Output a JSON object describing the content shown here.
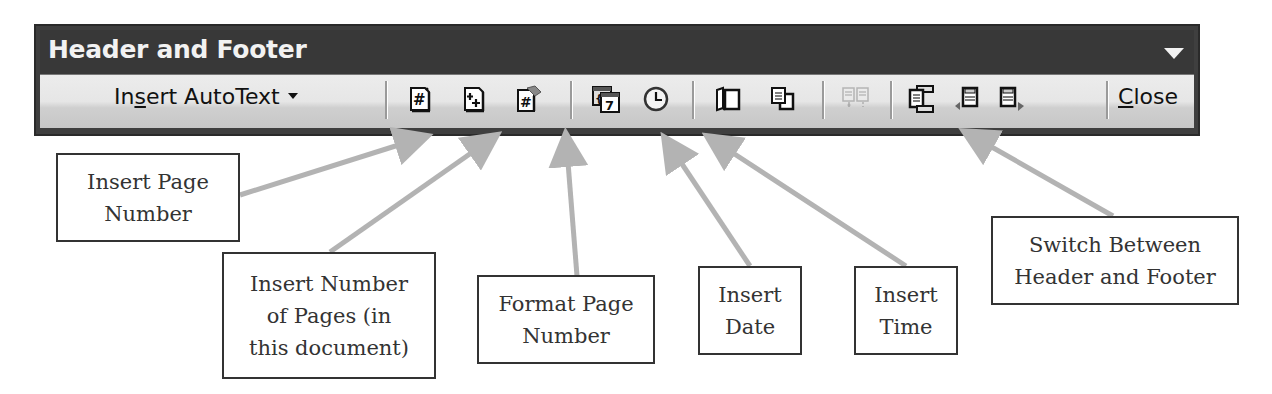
{
  "toolbar": {
    "title": "Header and Footer",
    "autotext": {
      "prefix": "In",
      "underlined": "s",
      "suffix": "ert AutoText"
    },
    "close": {
      "underlined": "C",
      "suffix": "lose"
    },
    "buttons": [
      {
        "name": "insert-page-number",
        "icon": "page-hash-icon"
      },
      {
        "name": "insert-number-of-pages",
        "icon": "page-plus-icon"
      },
      {
        "name": "format-page-number",
        "icon": "page-hash-format-icon"
      },
      {
        "name": "insert-date",
        "icon": "calendar-icon",
        "glyph": "7"
      },
      {
        "name": "insert-time",
        "icon": "clock-icon"
      },
      {
        "name": "page-setup",
        "icon": "open-book-icon"
      },
      {
        "name": "show-hide-document-text",
        "icon": "document-overlap-icon"
      },
      {
        "name": "same-as-previous",
        "icon": "link-pages-icon",
        "disabled": true
      },
      {
        "name": "switch-between-header-footer",
        "icon": "header-footer-switch-icon"
      },
      {
        "name": "show-previous",
        "icon": "previous-section-icon"
      },
      {
        "name": "show-next",
        "icon": "next-section-icon"
      }
    ]
  },
  "callouts": [
    {
      "id": "insert-page-number",
      "lines": [
        "Insert Page",
        "Number"
      ]
    },
    {
      "id": "insert-number-of-pages",
      "lines": [
        "Insert Number",
        "of Pages (in",
        "this document)"
      ]
    },
    {
      "id": "format-page-number",
      "lines": [
        "Format Page",
        "Number"
      ]
    },
    {
      "id": "insert-date",
      "lines": [
        "Insert",
        "Date"
      ]
    },
    {
      "id": "insert-time",
      "lines": [
        "Insert",
        "Time"
      ]
    },
    {
      "id": "switch-header-footer",
      "lines": [
        "Switch Between",
        "Header and Footer"
      ]
    }
  ],
  "colors": {
    "titlebar": "#383838",
    "title_text": "#f2f2f2",
    "arrow": "#b3b3b3",
    "callout_border": "#333333"
  }
}
